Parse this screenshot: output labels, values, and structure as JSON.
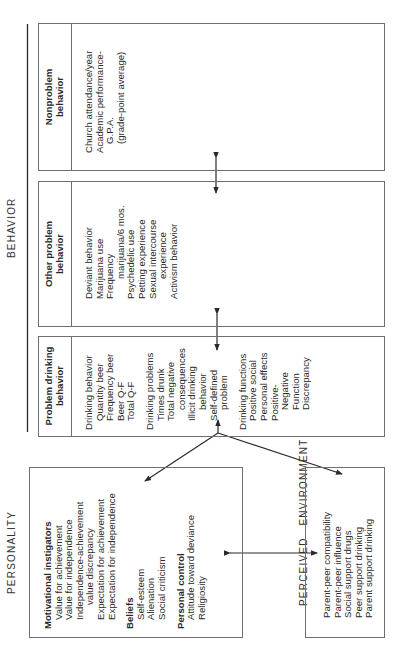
{
  "labels": {
    "behavior": "BEHAVIOR",
    "personality": "PERSONALITY",
    "perceived_environment": "PERCEIVED   ENVIRONMENT"
  },
  "behavior": {
    "nonproblem": {
      "header": [
        "Nonproblem",
        "behavior"
      ],
      "items": [
        "Church attendance/year",
        "Academic performance-",
        "G.P.A.",
        "(grade-point average)"
      ]
    },
    "other_problem": {
      "header": [
        "Other problem",
        "behavior"
      ],
      "items": [
        "Deviant behavior",
        "Marijuana use",
        "Frequency",
        "marijuana/6 mos.",
        "Psychedelic use",
        "Petting experience",
        "Sexual intercourse",
        "experience",
        "Activism behavior"
      ]
    },
    "problem_drinking": {
      "header": [
        "Problem drinking",
        "behavior"
      ],
      "groups": [
        {
          "title": "Drinking behavior",
          "items": [
            "Quantity beer",
            "Frequency beer",
            "Beer Q-F",
            "Total Q-F"
          ]
        },
        {
          "title": "Drinking problems",
          "items": [
            "Times drunk",
            "Total negative",
            "consequences",
            "Illicit drinking",
            "behavior",
            "Self-defined",
            "problem"
          ]
        },
        {
          "title": "Drinking functions",
          "items": [
            "Positive social",
            "Personal effects",
            "Positive-",
            "Negative",
            "Function",
            "Discrepancy"
          ]
        }
      ]
    }
  },
  "personality": {
    "groups": [
      {
        "title": "Motivational instigators",
        "items": [
          "Value for achievement",
          "Value for independence",
          "Independence-achievement",
          "value discrepancy",
          "Expectation for achievement",
          "Expectation for independence"
        ]
      },
      {
        "title": "Beliefs",
        "items": [
          "Self-esteem",
          "Alienation",
          "Social criticism"
        ]
      },
      {
        "title": "Personal control",
        "items": [
          "Attitude toward deviance",
          "Religiosity"
        ]
      }
    ]
  },
  "perceived_environment": {
    "items": [
      "Parent-peer compatibility",
      "Parent-peer influence",
      "Social support drugs",
      "Peer support drinking",
      "Parent support drinking"
    ]
  },
  "colors": {
    "line": "#3a3a3a",
    "box_border": "#6f6f6f",
    "text": "#2a2a2a"
  }
}
